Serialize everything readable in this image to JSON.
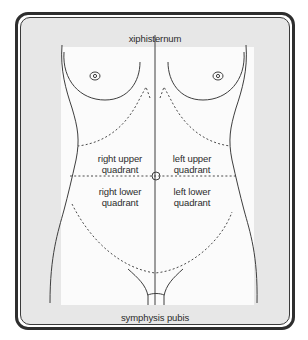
{
  "diagram": {
    "type": "anatomical abdominal quadrants (female torso, anterior view)",
    "labels": {
      "top": "xiphisternum",
      "bottom": "symphysis pubis"
    },
    "quadrants": {
      "right_upper": {
        "line1": "right upper",
        "line2": "quadrant"
      },
      "left_upper": {
        "line1": "left upper",
        "line2": "quadrant"
      },
      "right_lower": {
        "line1": "right lower",
        "line2": "quadrant"
      },
      "left_lower": {
        "line1": "left lower",
        "line2": "quadrant"
      }
    },
    "colors": {
      "frame": "#2e2e2e",
      "background": "#e7e7e7",
      "body_fill": "#fbfbfb",
      "line": "#444444",
      "text": "#2b2b2b"
    }
  }
}
